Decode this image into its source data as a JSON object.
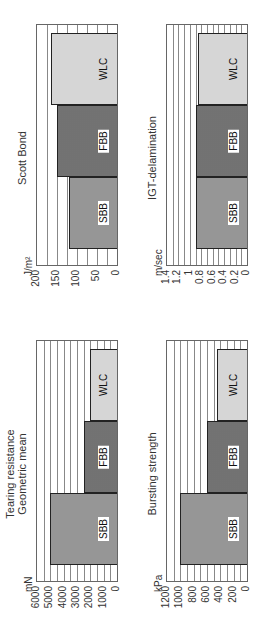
{
  "chart_data": [
    {
      "type": "bar",
      "title": "Tearing resistance\nGeometric mean",
      "title_lines": [
        "Tearing resistance",
        "Geometric mean"
      ],
      "ylabel": "mN",
      "categories": [
        "SBB",
        "FBB",
        "WLC"
      ],
      "values": [
        5000,
        2500,
        2000
      ],
      "ylim": [
        0,
        6000
      ],
      "yticks": [
        0,
        1000,
        2000,
        3000,
        4000,
        5000,
        6000
      ],
      "minor_grid_step": 500,
      "grid": true
    },
    {
      "type": "bar",
      "title": "Scott Bond",
      "title_lines": [
        "Scott Bond"
      ],
      "ylabel": "J/m²",
      "categories": [
        "SBB",
        "FBB",
        "WLC"
      ],
      "values": [
        120,
        150,
        165
      ],
      "ylim": [
        0,
        200
      ],
      "yticks": [
        0,
        50,
        100,
        150,
        200
      ],
      "minor_grid_step": 25,
      "grid": true
    },
    {
      "type": "bar",
      "title": "Bursting strength",
      "title_lines": [
        "Bursting strength"
      ],
      "ylabel": "kPa",
      "categories": [
        "SBB",
        "FBB",
        "WLC"
      ],
      "values": [
        1000,
        600,
        450
      ],
      "ylim": [
        0,
        1200
      ],
      "yticks": [
        0,
        200,
        400,
        600,
        800,
        1000,
        1200
      ],
      "minor_grid_step": 100,
      "grid": true
    },
    {
      "type": "bar",
      "title": "IGT-delamination",
      "title_lines": [
        "IGT-delamination"
      ],
      "ylabel": "m/sec",
      "categories": [
        "SBB",
        "FBB",
        "WLC"
      ],
      "values": [
        0.9,
        0.9,
        0.85
      ],
      "ylim": [
        0,
        1.4
      ],
      "yticks": [
        0,
        0.2,
        0.4,
        0.6,
        0.8,
        1,
        1.2,
        1.4
      ],
      "ytick_labels": [
        "0",
        "0.2",
        "0.4",
        "0.6",
        "0.8",
        "1",
        "1.2",
        "1.4"
      ],
      "minor_grid_step": 0.1,
      "grid": true
    }
  ],
  "layout": {
    "orientation": "rotated -90deg",
    "grid": "2x2"
  }
}
